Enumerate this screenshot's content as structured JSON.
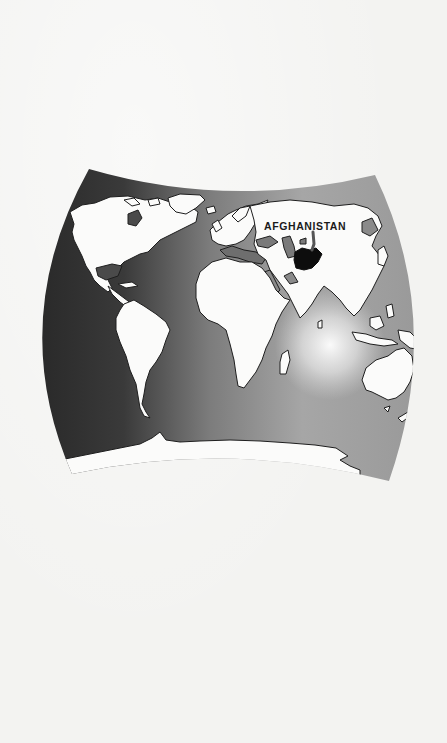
{
  "figure": {
    "type": "world-map",
    "projection_shape": "curved-sided quadrilateral (pseudo-cylindrical)",
    "highlighted_country": "Afghanistan",
    "label": "AFGHANISTAN",
    "pointer": "arrow from label pointing down to highlighted country"
  },
  "colors": {
    "paper": "#f3f3f1",
    "land": "#fbfbfa",
    "coastline": "#1e1e1e",
    "ocean_dark": "#2c2c2c",
    "ocean_mid": "#8a8a8a",
    "ocean_light": "#d8d8d8",
    "highlight": "#0d0d0d",
    "inland_water": "#7a7a7a"
  },
  "map_regions": [
    "North America",
    "South America",
    "Europe",
    "Africa",
    "Asia",
    "Australia",
    "Antarctica",
    "Greenland",
    "Madagascar",
    "New Zealand"
  ]
}
